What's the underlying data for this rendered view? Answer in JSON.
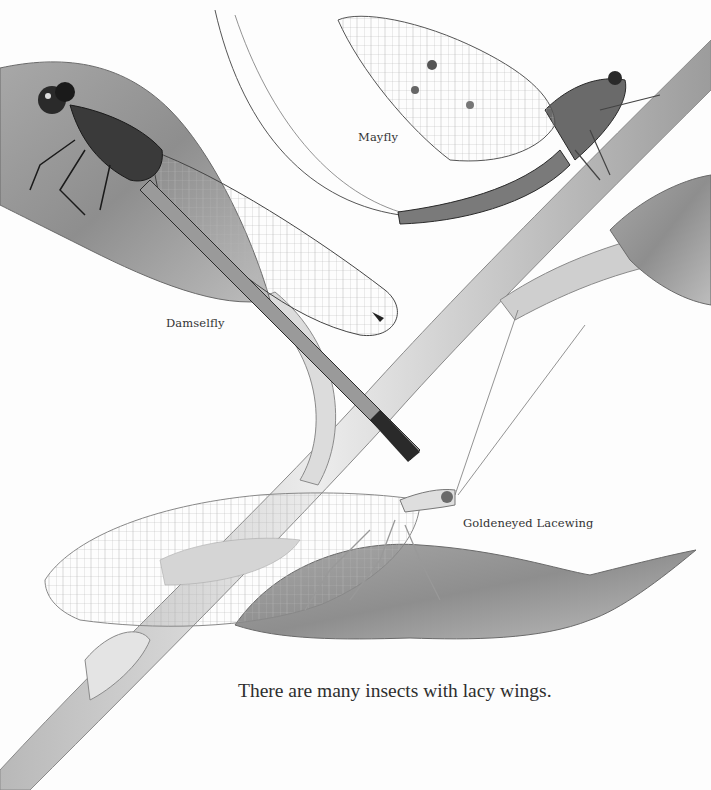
{
  "page": {
    "caption": "There are many insects with lacy wings.",
    "labels": {
      "mayfly": "Mayfly",
      "damselfly": "Damselfly",
      "lacewing": "Goldeneyed Lacewing"
    },
    "illustration": {
      "style": "pencil/graphite drawing",
      "subjects": [
        "damselfly",
        "mayfly",
        "goldeneyed lacewing",
        "plant stem",
        "leaves"
      ],
      "colors": {
        "background": "#fdfdfd",
        "leaf": "#9a9a9a",
        "stem": "#d8d8d8",
        "ink": "#2a2a2a",
        "wing": "#f2f2f2"
      }
    }
  }
}
